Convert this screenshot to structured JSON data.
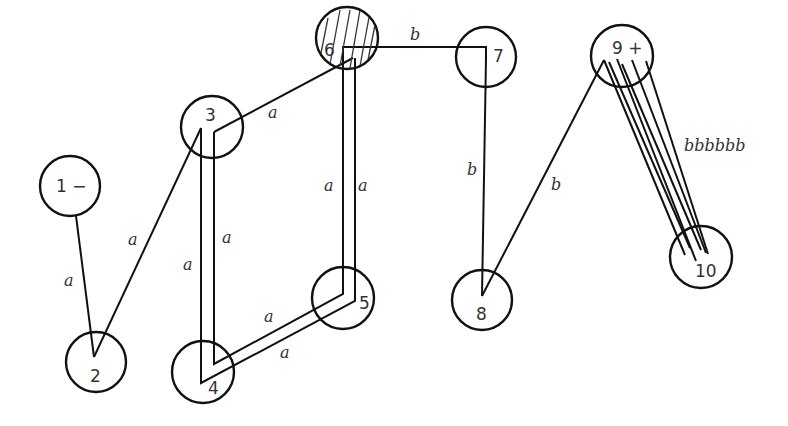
{
  "diagram": {
    "type": "labeled-graph",
    "nodes": [
      {
        "id": "1",
        "label": "1 −",
        "cx": 70,
        "cy": 186,
        "r": 30
      },
      {
        "id": "2",
        "label": "2",
        "cx": 96,
        "cy": 362,
        "r": 30
      },
      {
        "id": "3",
        "label": "3",
        "cx": 212,
        "cy": 127,
        "r": 31
      },
      {
        "id": "4",
        "label": "4",
        "cx": 203,
        "cy": 372,
        "r": 31
      },
      {
        "id": "5",
        "label": "5",
        "cx": 343,
        "cy": 298,
        "r": 31
      },
      {
        "id": "6",
        "label": "6",
        "cx": 347,
        "cy": 38,
        "r": 31,
        "hatched": true
      },
      {
        "id": "7",
        "label": "7",
        "cx": 486,
        "cy": 57,
        "r": 30
      },
      {
        "id": "8",
        "label": "8",
        "cx": 482,
        "cy": 300,
        "r": 30
      },
      {
        "id": "9",
        "label": "9 +",
        "cx": 622,
        "cy": 56,
        "r": 31
      },
      {
        "id": "10",
        "label": "10",
        "cx": 701,
        "cy": 257,
        "r": 31
      }
    ],
    "edges": [
      {
        "from": "1",
        "to": "2",
        "label": "a"
      },
      {
        "from": "2",
        "to": "3",
        "label": "a"
      },
      {
        "from": "3",
        "to": "6",
        "label": "a"
      },
      {
        "from": "3",
        "to": "4",
        "label": "a",
        "parallel": 2
      },
      {
        "from": "4",
        "to": "5",
        "label": "a",
        "parallel": 2
      },
      {
        "from": "5",
        "to": "6",
        "label": "a",
        "parallel": 2
      },
      {
        "from": "6",
        "to": "7",
        "label": "b"
      },
      {
        "from": "7",
        "to": "8",
        "label": "b"
      },
      {
        "from": "8",
        "to": "9",
        "label": "b"
      },
      {
        "from": "9",
        "to": "10",
        "label": "bbbbbb",
        "parallel": 6
      }
    ],
    "edge_labels": {
      "e12": "a",
      "e23": "a",
      "e36": "a",
      "e34_left": "a",
      "e34_right": "a",
      "e45_top": "a",
      "e45_bottom": "a",
      "e56_left": "a",
      "e56_right": "a",
      "e67": "b",
      "e78": "b",
      "e89": "b",
      "e910": "bbbbbb"
    },
    "node_labels": {
      "n1": "1 −",
      "n2": "2",
      "n3": "3",
      "n4": "4",
      "n5": "5",
      "n6": "6",
      "n7": "7",
      "n8": "8",
      "n9": "9 +",
      "n10": "10"
    }
  }
}
